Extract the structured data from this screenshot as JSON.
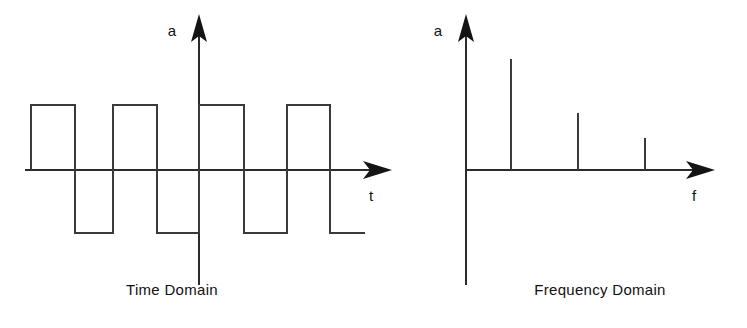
{
  "figure": {
    "background_color": "#ffffff",
    "line_color": "#3a3a3a",
    "axis_color": "#2b2b2b",
    "arrow_color": "#141414"
  },
  "panels": {
    "time": {
      "caption": "Time Domain",
      "y_axis_label": "a",
      "x_axis_label": "t",
      "y_axis_label_pos": {
        "x": 172,
        "y": 36
      },
      "x_axis_label_pos": {
        "x": 371,
        "y": 201
      },
      "caption_pos": {
        "x": 172,
        "y": 295
      },
      "axes": {
        "y_axis": {
          "x": 199,
          "y_top": 28,
          "y_bottom": 285
        },
        "x_axis": {
          "y": 170,
          "x_left": 25,
          "x_right": 375
        },
        "y_arrow_tip": {
          "x": 199,
          "y": 14
        },
        "x_arrow_tip": {
          "x": 392,
          "y": 170
        }
      },
      "waveform": {
        "baseline_y": 170,
        "high_y": 105,
        "low_y": 233,
        "points": "31,170 31,105 75,105 75,233 113,233 113,105 157,105 157,233 199,233 199,105 244,105 244,233 287,233 287,105 330,105 330,233 365,233",
        "transitions_x": [
          31,
          75,
          113,
          157,
          199,
          244,
          287,
          330,
          365
        ],
        "description": "square wave, 4 positive pulses and 4 negative pulses"
      }
    },
    "frequency": {
      "caption": "Frequency Domain",
      "y_axis_label": "a",
      "x_axis_label": "f",
      "y_axis_label_pos": {
        "x": 438,
        "y": 36
      },
      "x_axis_label_pos": {
        "x": 694,
        "y": 201
      },
      "caption_pos": {
        "x": 600,
        "y": 295
      },
      "axes": {
        "y_axis": {
          "x": 466,
          "y_top": 28,
          "y_bottom": 285
        },
        "x_axis": {
          "y": 170,
          "x_left": 466,
          "x_right": 698
        },
        "y_arrow_tip": {
          "x": 466,
          "y": 14
        },
        "x_arrow_tip": {
          "x": 715,
          "y": 170
        }
      },
      "spikes": [
        {
          "x": 511,
          "top_y": 59,
          "height": 111
        },
        {
          "x": 578,
          "top_y": 113,
          "height": 57
        },
        {
          "x": 645,
          "top_y": 138,
          "height": 32
        }
      ]
    }
  },
  "chart_data": [
    {
      "type": "line",
      "title": "Time Domain",
      "xlabel": "t",
      "ylabel": "a",
      "grid": false,
      "legend": "none",
      "xlim": [
        0,
        8
      ],
      "ylim": [
        -1,
        1
      ],
      "x": [
        0,
        1,
        1,
        2,
        2,
        3,
        3,
        4,
        4,
        5,
        5,
        6,
        6,
        7,
        7,
        8
      ],
      "values": [
        1,
        1,
        -1,
        -1,
        1,
        1,
        -1,
        -1,
        1,
        1,
        -1,
        -1,
        1,
        1,
        -1,
        -1
      ],
      "annotations": [
        "square wave alternating between +1 and -1"
      ]
    },
    {
      "type": "bar",
      "title": "Frequency Domain",
      "xlabel": "f",
      "ylabel": "a",
      "grid": false,
      "legend": "none",
      "categories": [
        "f0",
        "3f0",
        "5f0"
      ],
      "values": [
        1.0,
        0.51,
        0.29
      ],
      "ylim": [
        0,
        1.1
      ],
      "annotations": [
        "odd harmonics of the square wave with decreasing amplitude"
      ]
    }
  ]
}
